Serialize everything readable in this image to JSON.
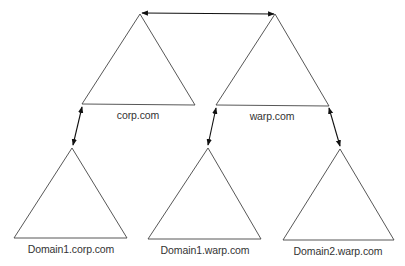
{
  "diagram": {
    "type": "domain-forest",
    "nodes": [
      {
        "id": "corp",
        "label": "corp.com"
      },
      {
        "id": "warp",
        "label": "warp.com"
      },
      {
        "id": "d1corp",
        "label": "Domain1.corp.com"
      },
      {
        "id": "d1warp",
        "label": "Domain1.warp.com"
      },
      {
        "id": "d2warp",
        "label": "Domain2.warp.com"
      }
    ],
    "edges": [
      {
        "from": "corp",
        "to": "warp",
        "style": "bidirectional-arrow"
      },
      {
        "from": "corp",
        "to": "d1corp",
        "style": "bidirectional-arrow"
      },
      {
        "from": "warp",
        "to": "d1warp",
        "style": "bidirectional-arrow"
      },
      {
        "from": "warp",
        "to": "d2warp",
        "style": "bidirectional-arrow"
      }
    ],
    "colors": {
      "line": "#333333",
      "arrow": "#111111",
      "background": "#ffffff"
    }
  }
}
